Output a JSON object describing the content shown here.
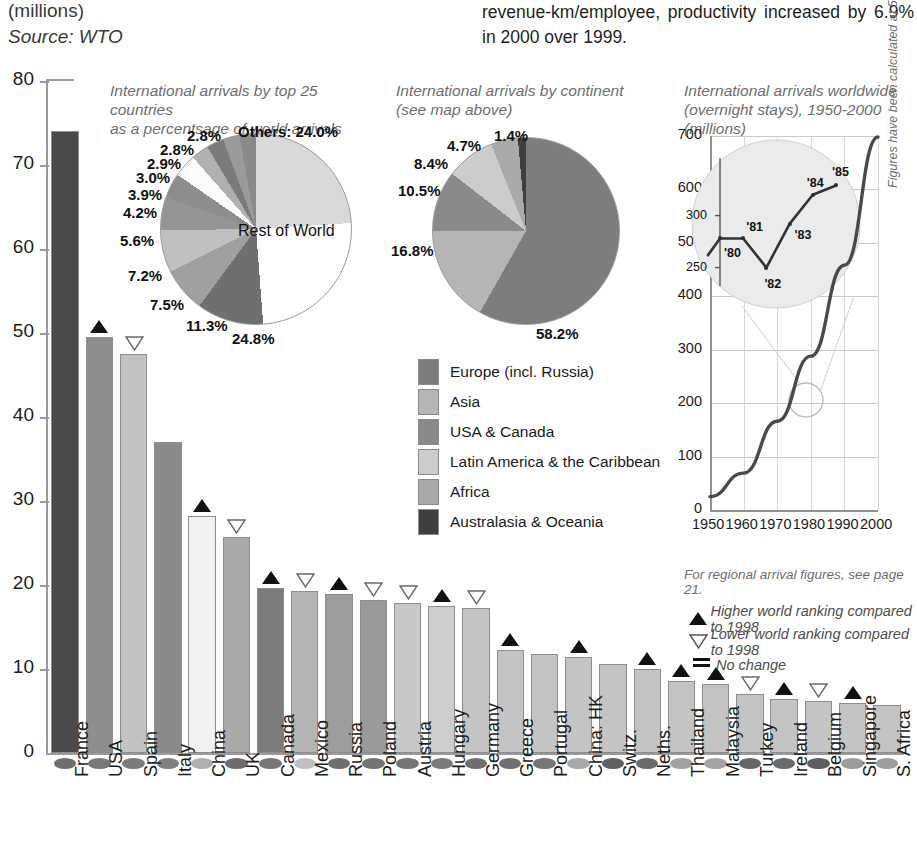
{
  "header": {
    "unit": "(millions)",
    "source": "Source: WTO",
    "body_text": "revenue-km/employee, productivity increased by 6.9% in 2000 over 1999."
  },
  "chart_data": [
    {
      "type": "bar",
      "title": "International arrivals by top 25 countries (millions)",
      "xlabel": "",
      "ylabel": "millions",
      "ylim": [
        0,
        80
      ],
      "yticks": [
        0,
        10,
        20,
        30,
        40,
        50,
        60,
        70,
        80
      ],
      "grid": false,
      "categories": [
        "France",
        "USA",
        "Spain",
        "Italy",
        "China",
        "UK",
        "Canada",
        "Mexico",
        "Russia",
        "Poland",
        "Austria",
        "Hungary",
        "Germany",
        "Greece",
        "Portugal",
        "China: HK",
        "Switz.",
        "Neths.",
        "Thailand",
        "Malaysia",
        "Turkey",
        "Ireland",
        "Belgium",
        "Singapore",
        "S. Africa"
      ],
      "values": [
        74.0,
        49.5,
        47.5,
        37.0,
        28.2,
        25.7,
        19.7,
        19.3,
        18.9,
        18.2,
        17.8,
        17.5,
        17.3,
        12.3,
        11.8,
        11.4,
        10.6,
        10.0,
        8.6,
        8.2,
        7.0,
        6.4,
        6.2,
        6.0,
        5.7
      ],
      "markers": [
        "=",
        "up",
        "down",
        "=",
        "up",
        "down",
        "up",
        "down",
        "up",
        "down",
        "down",
        "up",
        "down",
        "up",
        "=",
        "up",
        "=",
        "up",
        "up",
        "up",
        "down",
        "up",
        "down",
        "up",
        "="
      ],
      "bar_colors": [
        "#4a4a4a",
        "#8e8e8e",
        "#c2c2c2",
        "#8a8a8a",
        "#f1f1f1",
        "#aaaaaa",
        "#7c7c7c",
        "#b4b4b4",
        "#9d9d9d",
        "#9a9a9a",
        "#c8c8c8",
        "#cdcdcd",
        "#c4c4c4",
        "#c4c4c4",
        "#c4c4c4",
        "#c4c4c4",
        "#c4c4c4",
        "#c4c4c4",
        "#c4c4c4",
        "#c4c4c4",
        "#c4c4c4",
        "#c4c4c4",
        "#c4c4c4",
        "#c4c4c4",
        "#c4c4c4"
      ],
      "dot_colors": [
        "#6e6e6e",
        "#787878",
        "#7b7b7b",
        "#7f7f7f",
        "#b0b0b0",
        "#6d6d6d",
        "#777777",
        "#c0c0c0",
        "#6f6f6f",
        "#737373",
        "#747474",
        "#7a7a7a",
        "#6f6f6f",
        "#707070",
        "#757575",
        "#a9a9a9",
        "#606060",
        "#6a6a6a",
        "#a2a2a2",
        "#a4a4a4",
        "#666666",
        "#6a6a6a",
        "#5e5e5e",
        "#9b9b9b",
        "#9d9d9d"
      ]
    },
    {
      "type": "pie",
      "title": "International arrivals by top 25 countries as a percentsage of world arrivals",
      "labels": [
        "Others: 24.0%",
        "Rest of World",
        "24.8%",
        "11.3%",
        "7.5%",
        "7.2%",
        "5.6%",
        "4.2%",
        "3.9%",
        "3.0%",
        "2.9%",
        "2.8%",
        "2.8%"
      ],
      "slice_values": [
        24.0,
        24.8,
        11.3,
        7.5,
        7.2,
        5.6,
        4.2,
        3.9,
        3.0,
        2.9,
        2.8,
        2.8
      ],
      "slice_labels": [
        "Others: 24.0%",
        "24.8%",
        "11.3%",
        "7.5%",
        "7.2%",
        "5.6%",
        "4.2%",
        "3.9%",
        "3.0%",
        "2.9%",
        "2.8%",
        "2.8%"
      ],
      "rest_of_world_label": "Rest of World",
      "slice_colors": [
        "#d9d9d9",
        "#ffffff",
        "#6f6f6f",
        "#a0a0a0",
        "#c0c0c0",
        "#949494",
        "#8d8d8d",
        "#fbfbfb",
        "#b0b0b0",
        "#7b7b7b",
        "#9a9a9a",
        "#8a8a8a"
      ]
    },
    {
      "type": "pie",
      "title": "International arrivals by continent (see map above)",
      "slice_labels": [
        "58.2%",
        "16.8%",
        "10.5%",
        "8.4%",
        "4.7%",
        "1.4%"
      ],
      "slice_values": [
        58.2,
        16.8,
        10.5,
        8.4,
        4.7,
        1.4
      ],
      "legend": [
        "Europe (incl. Russia)",
        "Asia",
        "USA & Canada",
        "Latin America & the Caribbean",
        "Africa",
        "Australasia & Oceania"
      ],
      "slice_colors": [
        "#7d7d7d",
        "#b5b5b5",
        "#8a8a8a",
        "#cccccc",
        "#aaaaaa",
        "#3f3f3f"
      ]
    },
    {
      "type": "line",
      "title": "International arrivals worldwide (overnight stays), 1950-2000 (millions)",
      "xlabel": "",
      "ylabel": "millions",
      "ylim": [
        0,
        700
      ],
      "yticks": [
        0,
        100,
        200,
        300,
        400,
        500,
        600,
        700
      ],
      "xticks": [
        "1950",
        "1960",
        "1970",
        "1980",
        "1990",
        "2000"
      ],
      "x": [
        1950,
        1960,
        1970,
        1980,
        1990,
        2000
      ],
      "values": [
        25,
        69,
        166,
        288,
        458,
        698
      ],
      "grid": true,
      "note": "For regional arrival figures, see page 21.",
      "side_note": "Figures have been calculated at 5-year intervals, save for 1980-85 (on inset)",
      "inset": {
        "yticks": [
          "250",
          "300"
        ],
        "point_labels": [
          "'80",
          "'81",
          "'82",
          "'83",
          "'84",
          "'85"
        ],
        "values": [
          278,
          278,
          250,
          292,
          320,
          329
        ]
      }
    }
  ],
  "titles": {
    "pie1": "International arrivals by top 25 countries\nas a percentsage of world arrivals",
    "pie1_l1": "International arrivals by top 25 countries",
    "pie1_l2": "as a percentsage of world arrivals",
    "pie2_l1": "International arrivals by continent",
    "pie2_l2": "(see map above)",
    "line_l1": "International arrivals worldwide",
    "line_l2": "(overnight stays), 1950-2000 (millions)"
  },
  "key": {
    "up": "Higher world ranking compared to 1998",
    "down": "Lower world ranking compared to 1998",
    "equal": "No change",
    "up_symbol": "triangle-up-icon",
    "down_symbol": "triangle-down-icon",
    "equal_symbol": "equals-icon"
  }
}
